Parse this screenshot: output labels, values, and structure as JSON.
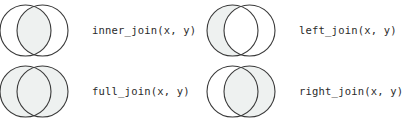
{
  "figure": {
    "background_color": "#ffffff",
    "circle_stroke_color": "#3a3a3a",
    "circle_fill_color": "#eef1f0",
    "circle_unfilled_color": "#ffffff",
    "label_color": "#2b2b2b",
    "stroke_width": 1.1,
    "circle_radius": 25.5,
    "left_circle_cx": 25.5,
    "right_circle_cx": 42.5,
    "circle_cy": 30.5
  },
  "panels": [
    {
      "id": "inner-join",
      "label": "inner_join(x, y)",
      "shaded_region": "intersection",
      "left_filled": false,
      "right_filled": false,
      "intersection_filled": true
    },
    {
      "id": "left-join",
      "label": "left_join(x, y)",
      "shaded_region": "left-circle",
      "left_filled": true,
      "right_filled": false,
      "intersection_filled": true
    },
    {
      "id": "full-join",
      "label": "full_join(x, y)",
      "shaded_region": "both-circles",
      "left_filled": true,
      "right_filled": true,
      "intersection_filled": true
    },
    {
      "id": "right-join",
      "label": "right_join(x, y)",
      "shaded_region": "right-circle",
      "left_filled": false,
      "right_filled": true,
      "intersection_filled": true
    }
  ]
}
